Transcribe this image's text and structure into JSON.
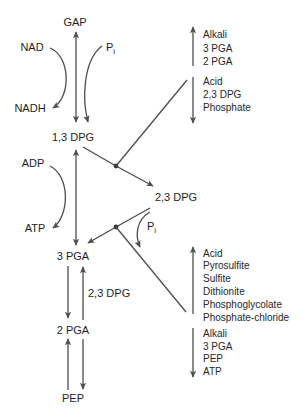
{
  "diagram": {
    "nodes": {
      "gap": "GAP",
      "dpg13": "1,3 DPG",
      "dpg23": "2,3 DPG",
      "pga3": "3 PGA",
      "pga2": "2 PGA",
      "pep": "PEP"
    },
    "cofactors": {
      "nad": "NAD",
      "nadh": "NADH",
      "adp": "ADP",
      "atp": "ATP",
      "pi_top": {
        "main": "P",
        "sub": "i"
      },
      "pi_mid": {
        "main": "P",
        "sub": "i"
      }
    },
    "mutase_cofactor": "2,3 DPG",
    "upper_right_effectors": {
      "up": [
        "Alkali",
        "3 PGA",
        "2 PGA"
      ],
      "down": [
        "Acid",
        "2,3 DPG",
        "Phosphate"
      ]
    },
    "lower_right_effectors": {
      "up": [
        "Acid",
        "Pyrosulfite",
        "Sulfite",
        "Dithionite",
        "Phosphoglycolate",
        "Phosphate-chloride"
      ],
      "down": [
        "Alkali",
        "3 PGA",
        "PEP",
        "ATP"
      ]
    },
    "colors": {
      "line": "#4d4d4d",
      "text": "#1e1e1e",
      "background": "#ffffff"
    }
  }
}
